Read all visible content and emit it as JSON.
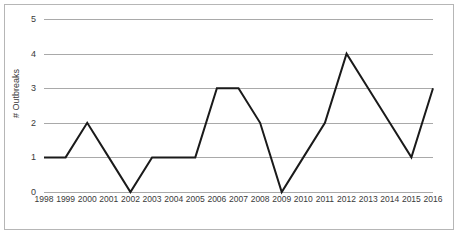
{
  "chart_data": {
    "type": "line",
    "title": "",
    "xlabel": "",
    "ylabel": "# Outbreaks",
    "categories": [
      "1998",
      "1999",
      "2000",
      "2001",
      "2002",
      "2003",
      "2004",
      "2005",
      "2006",
      "2007",
      "2008",
      "2009",
      "2010",
      "2011",
      "2012",
      "2013",
      "2014",
      "2015",
      "2016"
    ],
    "values": [
      1,
      1,
      2,
      1,
      0,
      1,
      1,
      1,
      3,
      3,
      2,
      0,
      1,
      2,
      4,
      3,
      2,
      1,
      3
    ],
    "ylim": [
      0,
      5
    ],
    "yticks": [
      0,
      1,
      2,
      3,
      4,
      5
    ],
    "ytick_labels": [
      "0",
      "1",
      "2",
      "3",
      "4",
      "5"
    ],
    "grid": true,
    "grid_axis": "y",
    "legend": false,
    "legend_position": "none",
    "series": [
      {
        "name": "# Outbreaks",
        "values": [
          1,
          1,
          2,
          1,
          0,
          1,
          1,
          1,
          3,
          3,
          2,
          0,
          1,
          2,
          4,
          3,
          2,
          1,
          3
        ]
      }
    ]
  },
  "style": {
    "line_color": "#1a1a1a",
    "grid_color": "#a9a9a9",
    "frame_color": "#b6b6b6",
    "text_color": "#3a3a3a",
    "background": "#ffffff"
  }
}
